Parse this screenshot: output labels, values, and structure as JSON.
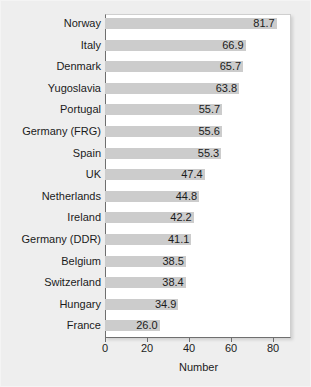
{
  "chart_data": {
    "type": "bar",
    "orientation": "horizontal",
    "title": "",
    "xlabel": "Number",
    "ylabel": "",
    "xlim": [
      0,
      88.5
    ],
    "xticks": [
      0,
      20,
      40,
      60,
      80
    ],
    "grid": false,
    "legend": null,
    "bar_color": "#cccccc",
    "background_color": "#eeeeee",
    "plot_background_color": "#ffffff",
    "axis_color": "#6f6f6f",
    "text_color": "#1b1b1b",
    "categories": [
      "Norway",
      "Italy",
      "Denmark",
      "Yugoslavia",
      "Portugal",
      "Germany (FRG)",
      "Spain",
      "UK",
      "Netherlands",
      "Ireland",
      "Germany (DDR)",
      "Belgium",
      "Switzerland",
      "Hungary",
      "France"
    ],
    "values": [
      81.7,
      66.9,
      65.7,
      63.8,
      55.7,
      55.6,
      55.3,
      47.4,
      44.8,
      42.2,
      41.1,
      38.5,
      38.4,
      34.9,
      26.0
    ],
    "value_labels": [
      "81.7",
      "66.9",
      "65.7",
      "63.8",
      "55.7",
      "55.6",
      "55.3",
      "47.4",
      "44.8",
      "42.2",
      "41.1",
      "38.5",
      "38.4",
      "34.9",
      "26.0"
    ]
  }
}
